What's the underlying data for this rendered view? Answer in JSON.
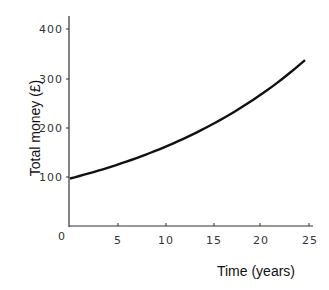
{
  "chart_data": {
    "type": "line",
    "title": "",
    "xlabel": "Time (years)",
    "ylabel": "Total money (£)",
    "xlim": [
      0,
      25
    ],
    "ylim": [
      0,
      400
    ],
    "x_ticks": [
      "0",
      "5",
      "10",
      "15",
      "20",
      "25"
    ],
    "y_ticks": [
      "100",
      "200",
      "300",
      "400"
    ],
    "grid": false,
    "series": [
      {
        "name": "Total money",
        "x": [
          0,
          5,
          10,
          15,
          20,
          25
        ],
        "values": [
          100,
          128,
          163,
          208,
          265,
          339
        ]
      }
    ]
  }
}
